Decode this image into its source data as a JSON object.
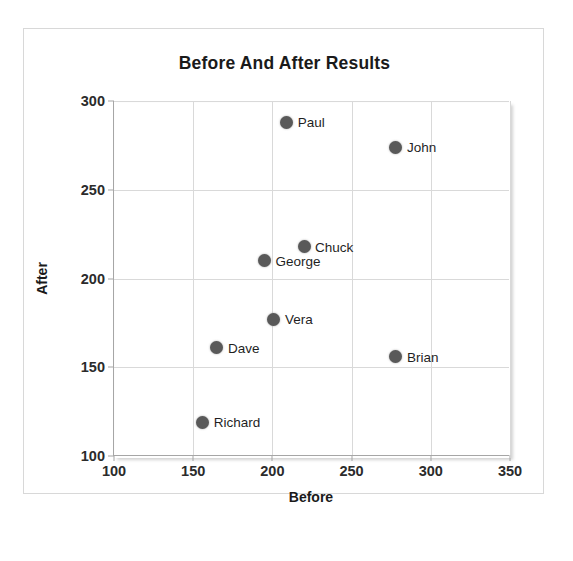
{
  "chart_data": {
    "type": "scatter",
    "title": "Before And After Results",
    "xlabel": "Before",
    "ylabel": "After",
    "xlim": [
      100,
      350
    ],
    "ylim": [
      100,
      300
    ],
    "xticks": [
      100,
      150,
      200,
      250,
      300,
      350
    ],
    "yticks": [
      100,
      150,
      200,
      250,
      300
    ],
    "grid": true,
    "legend": "none",
    "marker_color": "#595959",
    "gridline_color": "#d9d9d9",
    "axis_color": "#a6a6a6",
    "points": [
      {
        "label": "Paul",
        "x": 209,
        "y": 288
      },
      {
        "label": "John",
        "x": 278,
        "y": 274
      },
      {
        "label": "Chuck",
        "x": 220,
        "y": 218
      },
      {
        "label": "George",
        "x": 195,
        "y": 210
      },
      {
        "label": "Vera",
        "x": 201,
        "y": 177
      },
      {
        "label": "Dave",
        "x": 165,
        "y": 161
      },
      {
        "label": "Brian",
        "x": 278,
        "y": 156
      },
      {
        "label": "Richard",
        "x": 156,
        "y": 119
      }
    ]
  }
}
